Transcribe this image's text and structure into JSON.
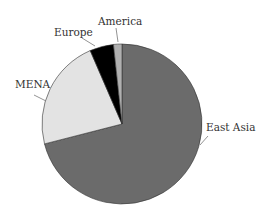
{
  "chart_data": {
    "type": "pie",
    "title": "",
    "start_angle_deg": 0,
    "direction": "clockwise",
    "categories": [
      "East Asia",
      "MENA",
      "Europe",
      "America"
    ],
    "values": [
      71,
      22.5,
      4.8,
      1.7
    ],
    "unit": "percent (estimated)",
    "colors": [
      "#6b6b6b",
      "#e3e3e3",
      "#000000",
      "#b0b0b0"
    ],
    "legend": "none (direct labels with leader lines)"
  },
  "labels": {
    "east_asia": "East Asia",
    "mena": "MENA",
    "europe": "Europe",
    "america": "America"
  }
}
